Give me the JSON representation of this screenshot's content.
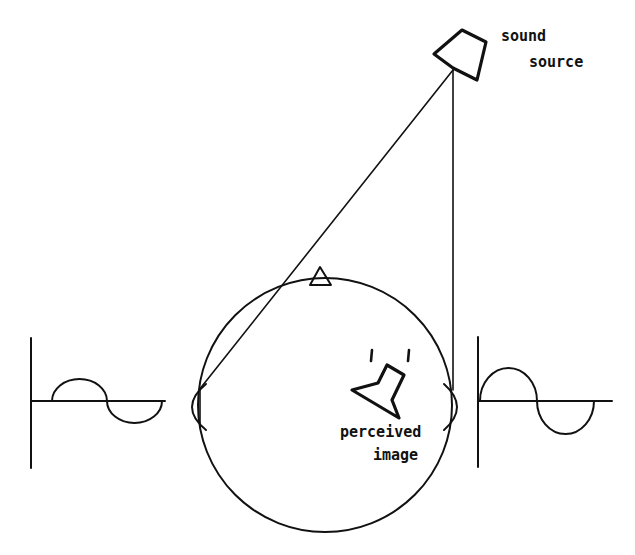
{
  "diagram": {
    "labels": {
      "sound_source_line1": "sound",
      "sound_source_line2": "source",
      "perceived_line1": "perceived",
      "perceived_line2": "image",
      "perceived_tick": "'  '"
    },
    "colors": {
      "stroke": "#111111",
      "background": "#ffffff"
    },
    "elements": {
      "head": {
        "cx": 325,
        "cy": 405,
        "r": 127
      },
      "nose": {
        "points": "310,285 320,267 331,285"
      },
      "left_ear": {
        "top": 385,
        "bottom": 430,
        "x": 199,
        "bulge": 187
      },
      "right_ear": {
        "top": 385,
        "bottom": 430,
        "x": 444,
        "bulge": 457
      },
      "sound_source_speaker": {
        "x": 453,
        "y": 68
      },
      "perceived_speaker": {
        "x": 385,
        "y": 395
      },
      "left_waveform": {
        "axis_x": 31,
        "axis_top": 338,
        "axis_bottom": 468,
        "baseline_y": 401,
        "baseline_end": 165,
        "phase": "late"
      },
      "right_waveform": {
        "axis_x": 478,
        "axis_top": 337,
        "axis_bottom": 467,
        "baseline_y": 401,
        "baseline_end": 612,
        "phase": "early"
      }
    }
  }
}
